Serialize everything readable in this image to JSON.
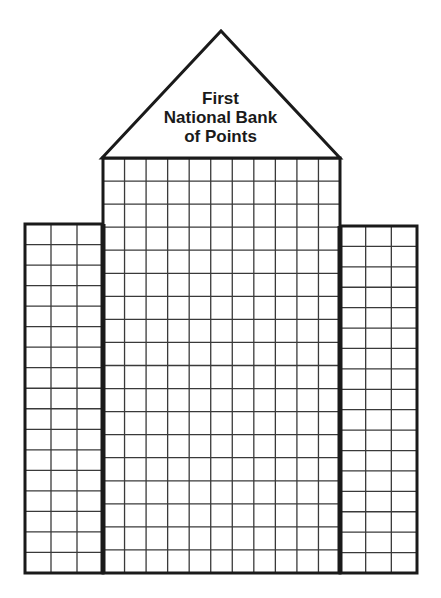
{
  "title": {
    "lines": [
      "First",
      "National Bank",
      "of Points"
    ]
  },
  "colors": {
    "background": "#ffffff",
    "ink": "#1a1a1a",
    "grid": "#3a3a3a"
  },
  "building": {
    "roof": {
      "apex": [
        221,
        31
      ],
      "base_left": [
        102,
        158
      ],
      "base_right": [
        340,
        158
      ]
    },
    "center_tower": {
      "x": 103,
      "y": 158,
      "width": 237,
      "height": 415,
      "columns": 11,
      "rows": 18
    },
    "left_wing": {
      "x": 25,
      "y": 224,
      "width": 78,
      "height": 349,
      "columns": 3,
      "rows": 17
    },
    "right_wing": {
      "x": 340,
      "y": 226,
      "width": 77,
      "height": 347,
      "columns": 3,
      "rows": 17
    }
  }
}
